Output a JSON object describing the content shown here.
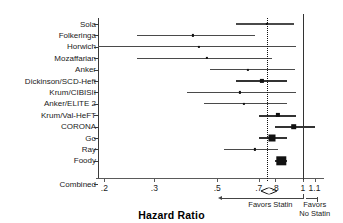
{
  "chart_data": {
    "type": "forest",
    "title": "",
    "xlabel": "Hazard Ratio",
    "ylabel": "",
    "xscale": "log",
    "xlim": [
      0.19,
      1.15
    ],
    "xticks": [
      0.2,
      0.3,
      0.5,
      0.7,
      0.8,
      1.0,
      1.1
    ],
    "xticklabels": [
      ".2",
      ".3",
      ".5",
      ".7",
      ".8",
      "1",
      "1.1"
    ],
    "null_value": 0.75,
    "reference_line": 1.0,
    "grid": false,
    "legend": null,
    "categories": [
      "Sola",
      "Folkeringa",
      "Horwich",
      "Mozaffarian",
      "Anker",
      "Dickinson/SCD-Heft",
      "Krum/CIBISII",
      "Anker/ELITE 2",
      "Krum/Val-HeFT",
      "CORONA",
      "Go",
      "Ray",
      "Foody"
    ],
    "studies": [
      {
        "label": "Sola",
        "hr": 0.75,
        "lo": 0.58,
        "hi": 0.93,
        "weight": 1
      },
      {
        "label": "Folkeringa",
        "hr": 0.41,
        "lo": 0.26,
        "hi": 0.68,
        "weight": 1
      },
      {
        "label": "Horwich",
        "hr": 0.43,
        "lo": 0.19,
        "hi": 0.95,
        "weight": 1
      },
      {
        "label": "Mozaffarian",
        "hr": 0.46,
        "lo": 0.26,
        "hi": 0.78,
        "weight": 1
      },
      {
        "label": "Anker",
        "hr": 0.64,
        "lo": 0.47,
        "hi": 0.94,
        "weight": 1
      },
      {
        "label": "Dickinson/SCD-Heft",
        "hr": 0.72,
        "lo": 0.58,
        "hi": 0.88,
        "weight": 2
      },
      {
        "label": "Krum/CIBISII",
        "hr": 0.6,
        "lo": 0.39,
        "hi": 0.95,
        "weight": 1
      },
      {
        "label": "Anker/ELITE 2",
        "hr": 0.62,
        "lo": 0.45,
        "hi": 0.88,
        "weight": 1
      },
      {
        "label": "Krum/Val-HeFT",
        "hr": 0.82,
        "lo": 0.7,
        "hi": 0.95,
        "weight": 2
      },
      {
        "label": "CORONA",
        "hr": 0.93,
        "lo": 0.8,
        "hi": 1.1,
        "weight": 3
      },
      {
        "label": "Go",
        "hr": 0.78,
        "lo": 0.7,
        "hi": 0.88,
        "weight": 4
      },
      {
        "label": "Ray",
        "hr": 0.68,
        "lo": 0.53,
        "hi": 0.82,
        "weight": 1
      },
      {
        "label": "Foody",
        "hr": 0.84,
        "lo": 0.8,
        "hi": 0.88,
        "weight": 5
      }
    ],
    "combined": {
      "label": "Combined",
      "hr": 0.76,
      "lo": 0.71,
      "hi": 0.81
    }
  },
  "annotations": {
    "favors_statin": "Favors Statin",
    "favors_no_statin_line1": "Favors",
    "favors_no_statin_line2": "No Statin"
  },
  "axis_title": "Hazard Ratio",
  "colors": {
    "marker": "#111111",
    "ci": "#4a4a4a",
    "axis": "#3a3a3a",
    "text": "#1a1a1a"
  }
}
